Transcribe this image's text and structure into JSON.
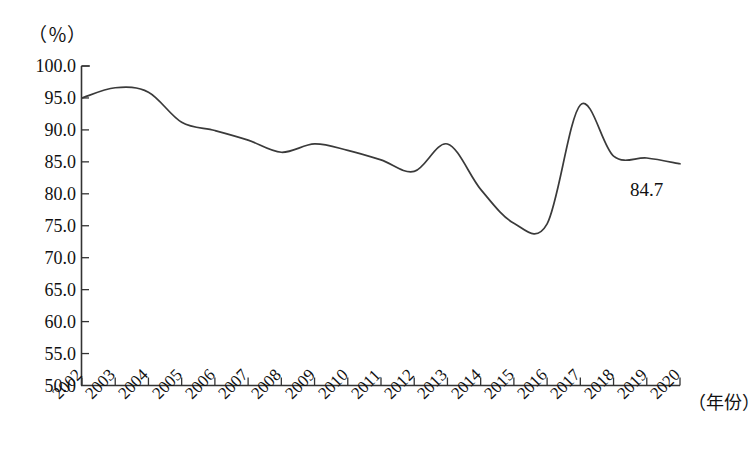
{
  "chart_data": {
    "type": "line",
    "title": "",
    "subtitle": "",
    "xlabel": "（年份）",
    "ylabel": "（％）",
    "categories": [
      "2002",
      "2003",
      "2004",
      "2005",
      "2006",
      "2007",
      "2008",
      "2009",
      "2010",
      "2011",
      "2012",
      "2013",
      "2014",
      "2015",
      "2016",
      "2017",
      "2018",
      "2019",
      "2020"
    ],
    "x": [
      2002,
      2003,
      2004,
      2005,
      2006,
      2007,
      2008,
      2009,
      2010,
      2011,
      2012,
      2013,
      2014,
      2015,
      2016,
      2017,
      2018,
      2019,
      2020
    ],
    "values": [
      95.0,
      96.6,
      95.9,
      91.2,
      89.9,
      88.4,
      86.5,
      87.8,
      86.8,
      85.3,
      83.5,
      87.8,
      80.7,
      75.4,
      75.3,
      93.9,
      85.9,
      85.6,
      84.7
    ],
    "series": [
      {
        "name": "",
        "values": [
          95.0,
          96.6,
          95.9,
          91.2,
          89.9,
          88.4,
          86.5,
          87.8,
          86.8,
          85.3,
          83.5,
          87.8,
          80.7,
          75.4,
          75.3,
          93.9,
          85.9,
          85.6,
          84.7
        ]
      }
    ],
    "ylim": [
      50.0,
      100.0
    ],
    "ytick_labels": [
      "100.0",
      "95.0",
      "90.0",
      "85.0",
      "80.0",
      "75.0",
      "70.0",
      "65.0",
      "60.0",
      "55.0",
      "50.0"
    ],
    "ytick_values": [
      100.0,
      95.0,
      90.0,
      85.0,
      80.0,
      75.0,
      70.0,
      65.0,
      60.0,
      55.0,
      50.0
    ],
    "grid": false,
    "legend": null,
    "line_color": "#3a3a3a",
    "annotations": [
      {
        "text": "84.7",
        "x": 2020,
        "y": 84.7
      }
    ]
  },
  "axis": {
    "unit_label": "（％）",
    "x_title": "（年份）"
  },
  "annotation": {
    "end_value": "84.7"
  }
}
